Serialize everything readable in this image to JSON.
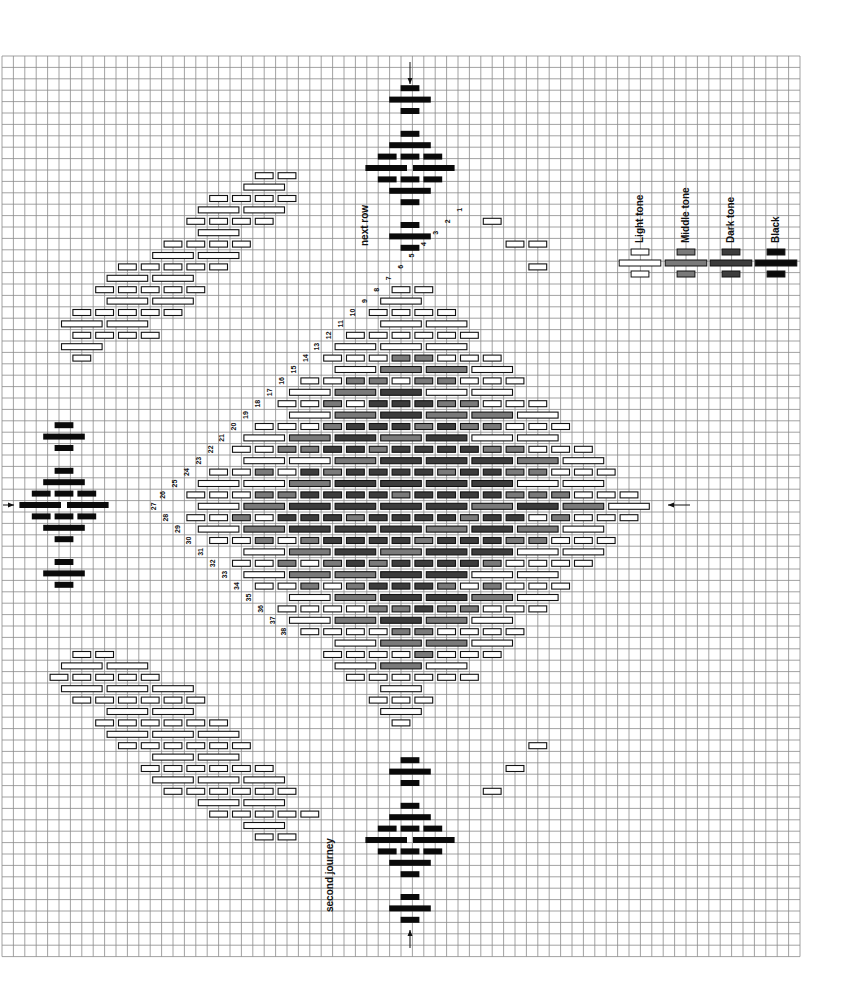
{
  "grid": {
    "x0": 2,
    "y0": 56,
    "cell": 11.4,
    "cols": 70,
    "rows": 79,
    "line_color": "#8a8a8a"
  },
  "legend": {
    "items": [
      {
        "label": "Light tone",
        "tone": "light",
        "cx": 640
      },
      {
        "label": "Middle tone",
        "tone": "middle",
        "cx": 686
      },
      {
        "label": "Dark tone",
        "tone": "dark",
        "cx": 731
      },
      {
        "label": "Black",
        "tone": "black",
        "cx": 776
      }
    ],
    "y": 263
  },
  "tones": {
    "light": "#ffffff",
    "middle": "#7a7a7a",
    "dark": "#3c3c3c",
    "black": "#0a0a0a",
    "outline": "#111111"
  },
  "annotations": {
    "next_row": "next row",
    "second_journey": "second journey"
  },
  "motifs": [
    {
      "name": "top-black-motif",
      "cx": 410,
      "cy": 168,
      "orient": "v"
    },
    {
      "name": "bottom-black-motif",
      "cx": 410,
      "cy": 840,
      "orient": "v"
    },
    {
      "name": "left-black-motif",
      "cx": 64,
      "cy": 505,
      "orient": "v"
    }
  ],
  "arrows": [
    {
      "name": "top-arrow",
      "x": 410,
      "y1": 62,
      "y2": 84
    },
    {
      "name": "bottom-arrow",
      "x": 410,
      "y1": 948,
      "y2": 930
    },
    {
      "name": "left-arrow",
      "x1": 3,
      "x2": 14,
      "y": 505
    },
    {
      "name": "right-arrow",
      "x1": 690,
      "x2": 668,
      "y": 505
    }
  ],
  "diamond": {
    "cx": 408,
    "cy": 505,
    "half_w": 250,
    "half_h": 240,
    "dark_half": 130,
    "mid_half": 175
  },
  "bands": [
    {
      "name": "upper-left-band",
      "from": [
        295,
        160
      ],
      "to": [
        70,
        370
      ],
      "width": 130
    },
    {
      "name": "lower-left-band",
      "from": [
        70,
        640
      ],
      "to": [
        295,
        850
      ],
      "width": 150
    },
    {
      "name": "upper-right-band",
      "from": [
        480,
        205
      ],
      "to": [
        560,
        290
      ],
      "width": 70
    },
    {
      "name": "lower-right-band",
      "from": [
        560,
        720
      ],
      "to": [
        480,
        805
      ],
      "width": 70
    }
  ],
  "numbered_labels": [
    "1",
    "2",
    "3",
    "4",
    "5",
    "6",
    "7",
    "8",
    "9",
    "10",
    "11",
    "12",
    "13",
    "14",
    "15",
    "16",
    "17",
    "18",
    "19",
    "20",
    "21",
    "22",
    "23",
    "24",
    "25",
    "26",
    "27",
    "28",
    "29",
    "30",
    "31",
    "32",
    "33",
    "34",
    "35",
    "36",
    "37",
    "38",
    "39",
    "40",
    "41",
    "42",
    "43",
    "44",
    "45",
    "46",
    "47",
    "48",
    "49",
    "50",
    "51",
    "52",
    "53",
    "54",
    "55",
    "56",
    "57",
    "58",
    "59",
    "60",
    "61",
    "62"
  ]
}
